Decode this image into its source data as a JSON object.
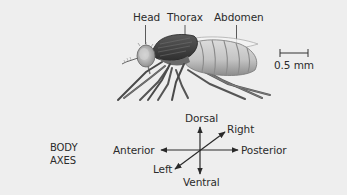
{
  "figure": {
    "anatomy_labels": {
      "head": "Head",
      "thorax": "Thorax",
      "abdomen": "Abdomen"
    },
    "scale_bar": {
      "label": "0.5 mm"
    },
    "body_axes": {
      "caption_line1": "BODY",
      "caption_line2": "AXES",
      "dorsal": "Dorsal",
      "ventral": "Ventral",
      "anterior": "Anterior",
      "posterior": "Posterior",
      "left": "Left",
      "right": "Right"
    }
  },
  "colors": {
    "background": "#eeeeee",
    "text": "#2b2b2b",
    "arrow": "#2a2a2a",
    "thorax": "#4a4a4a",
    "abdomen": "#c9c9c9",
    "head": "#b8b8b8"
  }
}
